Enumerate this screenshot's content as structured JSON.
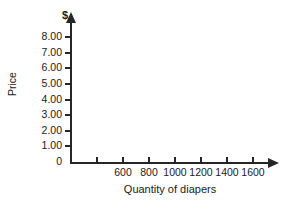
{
  "chart_data": {
    "type": "line",
    "title": "",
    "subtitle": "",
    "xlabel": "Quantity of diapers",
    "ylabel": "Price",
    "y_unit_symbol": "$",
    "origin_label": "0",
    "xlim": [
      300,
      1700
    ],
    "ylim": [
      0,
      8.5
    ],
    "grid": false,
    "legend": null,
    "series": [],
    "annotations": [],
    "note": "Blank axes template: no data plotted",
    "x_ticks": [
      {
        "value": 400,
        "label": "",
        "labeled": false
      },
      {
        "value": 600,
        "label": "600",
        "labeled": true
      },
      {
        "value": 800,
        "label": "800",
        "labeled": true
      },
      {
        "value": 1000,
        "label": "1000",
        "labeled": true
      },
      {
        "value": 1200,
        "label": "1200",
        "labeled": true
      },
      {
        "value": 1400,
        "label": "1400",
        "labeled": true
      },
      {
        "value": 1600,
        "label": "1600",
        "labeled": true
      }
    ],
    "y_ticks": [
      {
        "value": 1,
        "label": "1.00"
      },
      {
        "value": 2,
        "label": "2.00"
      },
      {
        "value": 3,
        "label": "3.00"
      },
      {
        "value": 4,
        "label": "4.00"
      },
      {
        "value": 5,
        "label": "5.00"
      },
      {
        "value": 6,
        "label": "6.00"
      },
      {
        "value": 7,
        "label": "7.00"
      },
      {
        "value": 8,
        "label": "8.00"
      }
    ],
    "colors": {
      "axis": "#262626",
      "text": "#1a1a1a",
      "background": "#ffffff"
    }
  }
}
